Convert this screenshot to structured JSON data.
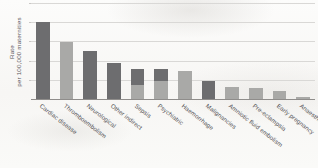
{
  "figure": {
    "axis": {
      "ylabel_line1": "Rate",
      "ylabel_line2": "per 100,000 maternities"
    },
    "colors": {
      "dark_bar": "#6d6d6f",
      "light_bar": "#a9a9a7",
      "gridline": "#d9d8d6",
      "axis": "#8f8d8b",
      "label_text": "#4e4c50"
    }
  },
  "chart_data": {
    "type": "bar",
    "title": "",
    "xlabel": "",
    "ylabel": "Rate per 100,000 maternities",
    "ylim": [
      0,
      5
    ],
    "grid": true,
    "gridlines": [
      1,
      2,
      3,
      4,
      5
    ],
    "legend": "none",
    "stacked": true,
    "categories": [
      "Cardiac disease",
      "Thromboembolism",
      "Neurological",
      "Other indirect",
      "Sepsis",
      "Psychiatric",
      "Haemorrhage",
      "Malignancies",
      "Amniotic fluid embolism",
      "Pre-eclampsia",
      "Early pregnancy",
      "Anaesthesia"
    ],
    "series": [
      {
        "name": "lower segment",
        "values": [
          0,
          2.95,
          0,
          0,
          0.75,
          0.95,
          1.45,
          0,
          0.65,
          0.55,
          0.4,
          0
        ]
      },
      {
        "name": "upper segment",
        "values": [
          4.0,
          0,
          2.5,
          1.85,
          0.8,
          0.6,
          0,
          0.95,
          0,
          0,
          0,
          0.12
        ]
      }
    ],
    "totals": [
      4.0,
      2.95,
      2.5,
      1.85,
      1.55,
      1.55,
      1.45,
      0.95,
      0.65,
      0.55,
      0.4,
      0.12
    ],
    "bar_styles": [
      "dark",
      "light",
      "dark",
      "dark",
      "stacked",
      "stacked",
      "light",
      "dark",
      "light",
      "light",
      "light",
      "light"
    ]
  }
}
